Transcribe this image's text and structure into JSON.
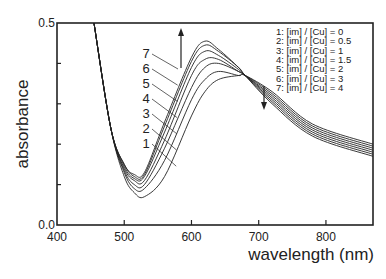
{
  "chart_data": {
    "type": "line",
    "title": "",
    "xlabel": "wavelength (nm)",
    "ylabel": "absorbance",
    "xlim": [
      400,
      870
    ],
    "ylim": [
      0.0,
      0.5
    ],
    "x_ticks": [
      "400",
      "500",
      "600",
      "700",
      "800"
    ],
    "y_ticks": [
      "0.0",
      "0.5"
    ],
    "grid": false,
    "legend_position": "upper right",
    "legend": [
      "1: [im] / [Cu] = 0",
      "2: [im] / [Cu] = 0.5",
      "3: [im] / [Cu] = 1",
      "4: [im] / [Cu] = 1.5",
      "5: [im] / [Cu] = 2",
      "6: [im] / [Cu] = 3",
      "7: [im] / [Cu] = 4"
    ],
    "annotations": [
      "arrow up near 580 nm (increasing with [im])",
      "arrow down near 705 nm (decreasing with [im])",
      "isosbestic point ~680 nm"
    ],
    "x": [
      455,
      480,
      500,
      515,
      530,
      560,
      600,
      620,
      640,
      670,
      680,
      720,
      780,
      870
    ],
    "series": [
      {
        "name": "1",
        "values": [
          0.5,
          0.24,
          0.12,
          0.08,
          0.07,
          0.12,
          0.27,
          0.33,
          0.36,
          0.37,
          0.37,
          0.33,
          0.25,
          0.2
        ]
      },
      {
        "name": "2",
        "values": [
          0.5,
          0.24,
          0.13,
          0.09,
          0.09,
          0.16,
          0.31,
          0.36,
          0.38,
          0.37,
          0.37,
          0.325,
          0.245,
          0.195
        ]
      },
      {
        "name": "3",
        "values": [
          0.5,
          0.24,
          0.135,
          0.1,
          0.1,
          0.19,
          0.34,
          0.39,
          0.4,
          0.38,
          0.37,
          0.32,
          0.24,
          0.19
        ]
      },
      {
        "name": "4",
        "values": [
          0.5,
          0.24,
          0.14,
          0.11,
          0.11,
          0.21,
          0.37,
          0.41,
          0.41,
          0.38,
          0.37,
          0.315,
          0.235,
          0.185
        ]
      },
      {
        "name": "5",
        "values": [
          0.5,
          0.24,
          0.145,
          0.115,
          0.12,
          0.23,
          0.39,
          0.43,
          0.42,
          0.385,
          0.37,
          0.31,
          0.23,
          0.18
        ]
      },
      {
        "name": "6",
        "values": [
          0.5,
          0.24,
          0.15,
          0.12,
          0.125,
          0.245,
          0.405,
          0.445,
          0.43,
          0.39,
          0.37,
          0.305,
          0.225,
          0.175
        ]
      },
      {
        "name": "7",
        "values": [
          0.5,
          0.24,
          0.15,
          0.125,
          0.13,
          0.255,
          0.415,
          0.455,
          0.435,
          0.39,
          0.37,
          0.3,
          0.22,
          0.17
        ]
      }
    ],
    "curve_labels": [
      "7",
      "6",
      "5",
      "4",
      "3",
      "2",
      "1"
    ]
  }
}
